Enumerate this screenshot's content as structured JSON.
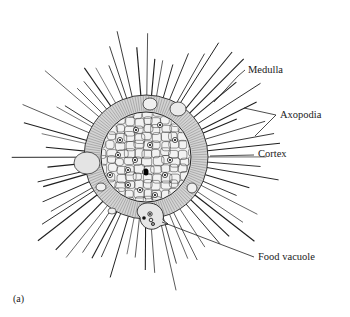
{
  "figure": {
    "panel_label": "(a)",
    "colors": {
      "background": "#ffffff",
      "ink": "#1f1f1f",
      "cortex_fill": "#d4d4d4",
      "medulla_fill": "#f2f2f2",
      "vacuole_fill": "#e6e6e6"
    },
    "labels": [
      {
        "id": "medulla",
        "text": "Medulla",
        "x": 248,
        "y": 65
      },
      {
        "id": "axopodia",
        "text": "Axopodia",
        "x": 280,
        "y": 110
      },
      {
        "id": "cortex",
        "text": "Cortex",
        "x": 258,
        "y": 149
      },
      {
        "id": "food_vacuole",
        "text": "Food vacuole",
        "x": 258,
        "y": 252
      }
    ],
    "leaders": [
      {
        "for": "medulla",
        "points": [
          [
            245,
            70
          ],
          [
            238,
            76
          ],
          [
            214,
            102
          ]
        ]
      },
      {
        "for": "axopodia",
        "points": [
          [
            276,
            115
          ],
          [
            244,
            108
          ]
        ]
      },
      {
        "for": "axopodia",
        "points": [
          [
            276,
            115
          ],
          [
            255,
            136
          ]
        ]
      },
      {
        "for": "cortex",
        "points": [
          [
            254,
            155
          ],
          [
            210,
            156
          ]
        ]
      },
      {
        "for": "food_vacuole",
        "points": [
          [
            254,
            257
          ],
          [
            162,
            222
          ]
        ]
      }
    ]
  }
}
